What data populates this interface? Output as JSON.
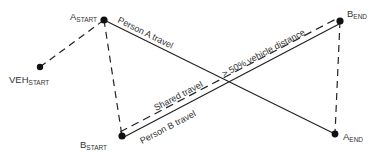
{
  "diagram": {
    "colors": {
      "line": "#222222",
      "text": "#333333",
      "node": "#111111",
      "background": "#ffffff"
    },
    "nodes": [
      {
        "id": "veh_start",
        "main": "VEH",
        "sub": "START",
        "x": 40,
        "y": 67
      },
      {
        "id": "a_start",
        "main": "A",
        "sub": "START",
        "x": 104,
        "y": 20
      },
      {
        "id": "b_end",
        "main": "B",
        "sub": "END",
        "x": 340,
        "y": 21
      },
      {
        "id": "b_start",
        "main": "B",
        "sub": "START",
        "x": 122,
        "y": 136
      },
      {
        "id": "a_end",
        "main": "A",
        "sub": "END",
        "x": 335,
        "y": 134
      }
    ],
    "edges": [
      {
        "from": "veh_start",
        "to": "a_start",
        "style": "dashed"
      },
      {
        "from": "a_start",
        "to": "b_start",
        "style": "dashed"
      },
      {
        "from": "b_start",
        "to": "b_end",
        "style": "dashed",
        "label": "Shared travel"
      },
      {
        "from": "b_end",
        "to": "a_end",
        "style": "dashed"
      },
      {
        "from": "a_start",
        "to": "a_end",
        "style": "solid",
        "label": "Person A travel"
      },
      {
        "from": "b_start",
        "to": "b_end",
        "style": "solid",
        "label": "Person B travel"
      }
    ],
    "labels": {
      "person_a": "Person A travel",
      "person_b": "Person B travel",
      "shared": "Shared travel",
      "condition": "> 50% vehicle distance"
    }
  }
}
